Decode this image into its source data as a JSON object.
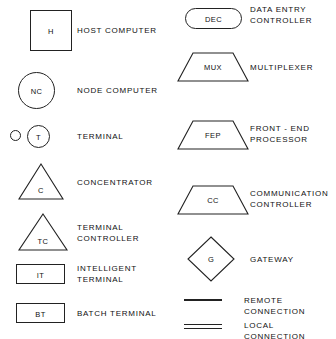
{
  "diagram": {
    "stroke_color": "#222222",
    "background_color": "#ffffff",
    "text_color": "#111111",
    "columns": [
      {
        "name": "left-column",
        "entries": [
          {
            "id": "host-computer",
            "symbol": "square",
            "symbol_text": "H",
            "label": "HOST COMPUTER"
          },
          {
            "id": "node-computer",
            "symbol": "circle",
            "symbol_text": "NC",
            "label": "NODE COMPUTER"
          },
          {
            "id": "terminal",
            "symbol": "dot-and-circle",
            "symbol_text": "T",
            "label": "TERMINAL"
          },
          {
            "id": "concentrator",
            "symbol": "triangle",
            "symbol_text": "C",
            "label": "CONCENTRATOR"
          },
          {
            "id": "terminal-controller",
            "symbol": "triangle",
            "symbol_text": "TC",
            "label": "TERMINAL\nCONTROLLER"
          },
          {
            "id": "intelligent-terminal",
            "symbol": "wide-rectangle",
            "symbol_text": "IT",
            "label": "INTELLIGENT\nTERMINAL"
          },
          {
            "id": "batch-terminal",
            "symbol": "wide-rectangle",
            "symbol_text": "BT",
            "label": "BATCH TERMINAL"
          }
        ]
      },
      {
        "name": "right-column",
        "entries": [
          {
            "id": "data-entry-controller",
            "symbol": "stadium",
            "symbol_text": "DEC",
            "label": "DATA ENTRY\nCONTROLLER"
          },
          {
            "id": "multiplexer",
            "symbol": "trapezoid",
            "symbol_text": "MUX",
            "label": "MULTIPLEXER"
          },
          {
            "id": "front-end-processor",
            "symbol": "trapezoid",
            "symbol_text": "FEP",
            "label": "FRONT - END\nPROCESSOR"
          },
          {
            "id": "communication-controller",
            "symbol": "trapezoid",
            "symbol_text": "CC",
            "label": "COMMUNICATION\nCONTROLLER"
          },
          {
            "id": "gateway",
            "symbol": "diamond",
            "symbol_text": "G",
            "label": "GATEWAY"
          },
          {
            "id": "remote-connection",
            "symbol": "single-line",
            "symbol_text": "",
            "label": "REMOTE CONNECTION"
          },
          {
            "id": "local-connection",
            "symbol": "double-line",
            "symbol_text": "",
            "label": "LOCAL CONNECTION"
          }
        ]
      }
    ]
  }
}
